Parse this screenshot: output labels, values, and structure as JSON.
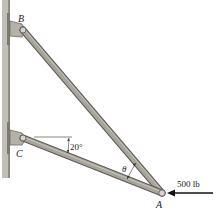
{
  "diagram": {
    "labels": {
      "B": "B",
      "C": "C",
      "A": "A",
      "theta": "θ",
      "angle_c": "20°",
      "force": "500 lb"
    },
    "colors": {
      "member_fill": "#a7a49c",
      "member_edge": "#5e5b55",
      "wall": "#b9b6ae",
      "wall_edge": "#8a877f",
      "text": "#222222",
      "arrow": "#111111"
    }
  }
}
